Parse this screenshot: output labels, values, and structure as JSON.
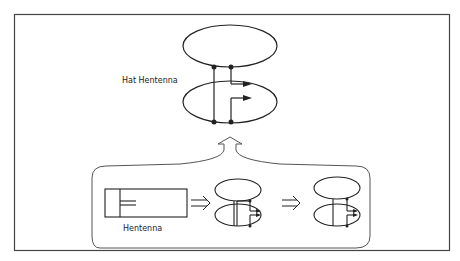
{
  "diagram": {
    "labels": {
      "hat_hentenna": "Hat Hentenna",
      "hentenna": "Hentenna"
    },
    "colors": {
      "line": "#222222",
      "frame": "#444444",
      "bracket": "#555555",
      "background": "#ffffff"
    },
    "stages": [
      {
        "name": "Hentenna",
        "shape": "rectangular loop with feed stub"
      },
      {
        "name": "intermediate",
        "shape": "split loop with hat ellipses"
      },
      {
        "name": "final",
        "shape": "hat hentenna small"
      }
    ],
    "arrows": [
      "double-arrow-right",
      "double-arrow-right",
      "bracket-arrow-up"
    ]
  }
}
